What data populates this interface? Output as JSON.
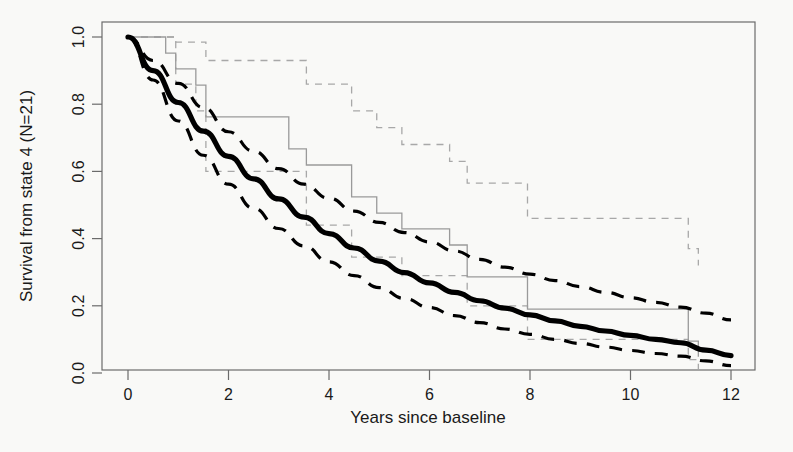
{
  "figure": {
    "background_color": "#f9f9f7",
    "width": 793,
    "height": 452
  },
  "axes": {
    "x_title": "Years since baseline",
    "y_title": "Survival from state 4 (N=21)",
    "x_ticks": [
      "0",
      "2",
      "4",
      "6",
      "8",
      "10",
      "12"
    ],
    "y_ticks": [
      "0.0",
      "0.2",
      "0.4",
      "0.6",
      "0.8",
      "1.0"
    ]
  },
  "chart_data": {
    "type": "line",
    "title": "",
    "xlabel": "Years since baseline",
    "ylabel": "Survival from state 4 (N=21)",
    "xlim": [
      0,
      12
    ],
    "ylim": [
      0.0,
      1.0
    ],
    "xticks": [
      0,
      2,
      4,
      6,
      8,
      10,
      12
    ],
    "yticks": [
      0.0,
      0.2,
      0.4,
      0.6,
      0.8,
      1.0
    ],
    "grid": false,
    "legend": "none",
    "series": [
      {
        "name": "Fitted model survival",
        "style": "solid-bold-black",
        "color": "#000000",
        "x": [
          0,
          0.5,
          1,
          1.5,
          2,
          2.5,
          3,
          3.5,
          4,
          4.5,
          5,
          5.5,
          6,
          6.5,
          7,
          7.5,
          8,
          8.5,
          9,
          9.5,
          10,
          10.5,
          11,
          11.5,
          12
        ],
        "values": [
          1.0,
          0.9,
          0.805,
          0.72,
          0.645,
          0.578,
          0.518,
          0.464,
          0.415,
          0.372,
          0.333,
          0.299,
          0.268,
          0.24,
          0.215,
          0.193,
          0.173,
          0.155,
          0.139,
          0.125,
          0.112,
          0.1,
          0.09,
          0.068,
          0.052
        ]
      },
      {
        "name": "Model 95% CI upper",
        "style": "dashed-black",
        "color": "#000000",
        "x": [
          0,
          0.5,
          1,
          1.5,
          2,
          2.5,
          3,
          3.5,
          4,
          4.5,
          5,
          5.5,
          6,
          6.5,
          7,
          7.5,
          8,
          8.5,
          9,
          9.5,
          10,
          10.5,
          11,
          11.5,
          12
        ],
        "values": [
          1.0,
          0.93,
          0.862,
          0.79,
          0.718,
          0.66,
          0.608,
          0.562,
          0.52,
          0.482,
          0.448,
          0.418,
          0.39,
          0.363,
          0.338,
          0.315,
          0.294,
          0.275,
          0.257,
          0.24,
          0.224,
          0.21,
          0.196,
          0.178,
          0.158
        ]
      },
      {
        "name": "Model 95% CI lower",
        "style": "dashed-black",
        "color": "#000000",
        "x": [
          0,
          0.5,
          1,
          1.5,
          2,
          2.5,
          3,
          3.5,
          4,
          4.5,
          5,
          5.5,
          6,
          6.5,
          7,
          7.5,
          8,
          8.5,
          9,
          9.5,
          10,
          10.5,
          11,
          11.5,
          12
        ],
        "values": [
          1.0,
          0.872,
          0.75,
          0.648,
          0.562,
          0.49,
          0.43,
          0.378,
          0.331,
          0.29,
          0.254,
          0.222,
          0.195,
          0.171,
          0.15,
          0.131,
          0.115,
          0.1,
          0.088,
          0.077,
          0.067,
          0.058,
          0.05,
          0.036,
          0.022
        ]
      },
      {
        "name": "Kaplan-Meier estimate",
        "style": "step-gray",
        "color": "#9a9a9a",
        "x": [
          0,
          0.55,
          0.75,
          0.95,
          1.35,
          1.55,
          2.85,
          3.2,
          3.55,
          4.45,
          4.95,
          5.45,
          6.4,
          6.75,
          7.95,
          10.85,
          11.15,
          11.35
        ],
        "values": [
          1.0,
          1.0,
          0.952,
          0.905,
          0.857,
          0.762,
          0.762,
          0.667,
          0.619,
          0.524,
          0.476,
          0.429,
          0.381,
          0.286,
          0.19,
          0.19,
          0.095,
          0.048
        ]
      },
      {
        "name": "Kaplan-Meier 95% CI upper",
        "style": "step-dashed-gray",
        "color": "#a8a8a8",
        "x": [
          0,
          0.55,
          0.95,
          1.55,
          2.85,
          3.55,
          4.45,
          4.95,
          5.45,
          6.4,
          6.75,
          7.95,
          10.85,
          11.15,
          11.35
        ],
        "values": [
          1.0,
          1.0,
          0.985,
          0.93,
          0.93,
          0.86,
          0.78,
          0.73,
          0.68,
          0.63,
          0.565,
          0.46,
          0.46,
          0.37,
          0.32
        ]
      },
      {
        "name": "Kaplan-Meier 95% CI lower",
        "style": "step-dashed-gray",
        "color": "#a8a8a8",
        "x": [
          0,
          0.55,
          0.95,
          1.35,
          1.55,
          2.85,
          3.55,
          4.45,
          5.45,
          6.75,
          7.95,
          10.85,
          11.15,
          11.35
        ],
        "values": [
          1.0,
          1.0,
          0.86,
          0.78,
          0.6,
          0.6,
          0.44,
          0.345,
          0.29,
          0.2,
          0.1,
          0.1,
          0.04,
          0.01
        ]
      }
    ]
  }
}
